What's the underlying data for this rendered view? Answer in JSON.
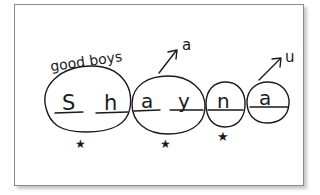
{
  "figure": {
    "label": "good boys",
    "name": "Shayna",
    "groups": [
      {
        "letters": [
          "S",
          "h"
        ],
        "star": true
      },
      {
        "letters": [
          "a",
          "y"
        ],
        "star": true,
        "arrow_label": "a"
      },
      {
        "letters": [
          "n"
        ],
        "star": true
      },
      {
        "letters": [
          "a"
        ],
        "star": false,
        "arrow_label": "u"
      }
    ],
    "letters": [
      "S",
      "h",
      "a",
      "y",
      "n",
      "a"
    ],
    "arrows": [
      {
        "label": "a"
      },
      {
        "label": "u"
      }
    ],
    "stars": [
      "★",
      "★",
      "★"
    ],
    "colors": {
      "ink": "#1a1a1a",
      "frame": "#8a8a8a",
      "background": "#ffffff"
    }
  }
}
